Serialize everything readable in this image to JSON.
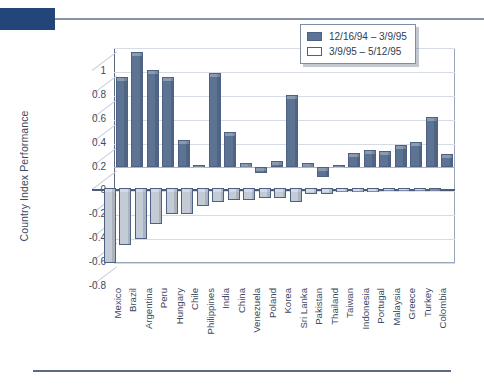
{
  "chart_data": {
    "type": "bar",
    "title": "",
    "xlabel": "",
    "ylabel": "Country Index Performance",
    "ylim": [
      -0.8,
      1.0
    ],
    "ytick_labels": [
      "1",
      "0.8",
      "0.6",
      "0.4",
      "0.2",
      "0",
      "-0.2",
      "-0.4",
      "-0.6",
      "-0.8"
    ],
    "ytick_values": [
      1,
      0.8,
      0.6,
      0.4,
      0.2,
      0,
      -0.2,
      -0.4,
      -0.6,
      -0.8
    ],
    "grid": true,
    "legend_position": "top-right",
    "categories": [
      "Mexico",
      "Brazil",
      "Argentina",
      "Peru",
      "Hungary",
      "Chile",
      "Philippines",
      "India",
      "China",
      "Venezuela",
      "Poland",
      "Korea",
      "Sri Lanka",
      "Pakistan",
      "Thailand",
      "Taiwan",
      "Indonesia",
      "Portugal",
      "Malaysia",
      "Greece",
      "Turkey",
      "Colombia"
    ],
    "series": [
      {
        "name": "12/16/94 – 3/9/95",
        "color": "#5c7394",
        "values": [
          0.76,
          0.97,
          0.82,
          0.76,
          0.23,
          0.02,
          0.79,
          0.3,
          0.04,
          -0.05,
          0.05,
          0.61,
          0.04,
          -0.08,
          0.02,
          0.12,
          0.15,
          0.14,
          0.19,
          0.21,
          0.42,
          0.11
        ]
      },
      {
        "name": "3/9/95 – 5/12/95",
        "color": "#c3ccd6",
        "values": [
          -0.63,
          -0.48,
          -0.43,
          -0.3,
          -0.22,
          -0.22,
          -0.15,
          -0.12,
          -0.1,
          -0.1,
          -0.09,
          -0.09,
          -0.12,
          -0.05,
          -0.05,
          -0.04,
          -0.04,
          -0.04,
          -0.03,
          -0.03,
          -0.03,
          -0.02
        ]
      }
    ]
  },
  "legend": {
    "entries": [
      {
        "label": "12/16/94 – 3/9/95",
        "swatch": "filled"
      },
      {
        "label": "3/9/95 – 5/12/95",
        "swatch": "hollow"
      }
    ]
  },
  "colors": {
    "accent": "#22457a",
    "series_1": "#5c7394",
    "series_2": "#c3ccd6",
    "axis": "#5a6a85",
    "grid": "#d6dce6",
    "text": "#3c4a63"
  }
}
